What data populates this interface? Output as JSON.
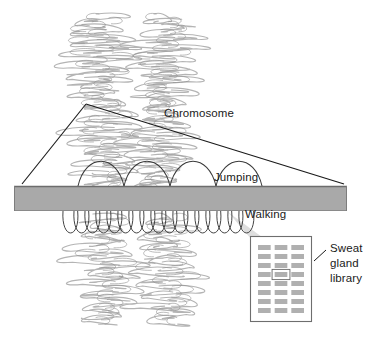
{
  "figure": {
    "background_color": "#ffffff",
    "width": 377,
    "height": 341,
    "top_cut_caption": "",
    "labels": {
      "chromosome": "Chromosome",
      "jumping": "Jumping",
      "walking": "Walking",
      "library_line1": "Sweat",
      "library_line2": "gland",
      "library_line3": "library"
    },
    "colors": {
      "chromatin": "#b4b4b4",
      "chromatin_dark": "#8e8e8e",
      "bar_fill": "#a9a9a9",
      "bar_edge": "#6e6e6e",
      "leader_line": "#1a1a1a",
      "loop_stroke": "#3a3a3a",
      "band_fill": "#b0b0b0",
      "band_highlight_stroke": "#6a6a6a",
      "box_edge": "#6e6e6e",
      "cone_fill": "#d8d8d8",
      "text": "#1a1a1a"
    },
    "chromosome": {
      "description": "Metaphase chromosome drawn as two sister chromatids of densely coiled chromatin loops",
      "arm_count": 2,
      "left_arm_center_x": 104,
      "right_arm_center_x": 163,
      "top_y": 14,
      "bottom_y": 322
    },
    "bar": {
      "name": "chromosome-region-bar",
      "x": 14,
      "y": 186,
      "width": 333,
      "height": 25
    },
    "jumping_arcs": {
      "count": 4,
      "description": "Large arcs above the bar representing chromosome jumping over long distances",
      "start_x": 78,
      "arc_width": 46,
      "arc_height": 22,
      "baseline_y": 186
    },
    "walking_loops": {
      "count": 17,
      "description": "Small tight successive loops below the bar representing stepwise chromosome walking",
      "start_x": 63,
      "loop_width": 11,
      "loop_height": 24,
      "baseline_y": 211
    },
    "leader_lines": [
      {
        "name": "chromosome-leader-left",
        "x1": 86,
        "y1": 104,
        "x2": 22,
        "y2": 184
      },
      {
        "name": "chromosome-leader-right",
        "x1": 86,
        "y1": 104,
        "x2": 344,
        "y2": 184
      }
    ],
    "library_pointer": {
      "name": "library-pointer-line",
      "x1": 325,
      "y1": 252,
      "x2": 313,
      "y2": 262
    },
    "library_cone": {
      "name": "walking-to-library-cone",
      "apex_x": 228,
      "apex_y": 212,
      "base_left_x": 252,
      "base_right_x": 266,
      "base_y": 240
    }
  },
  "library_box": {
    "name": "sweat-gland-library-panel",
    "x": 250,
    "y": 236,
    "width": 62,
    "height": 86,
    "columns": 3,
    "rows": 8,
    "highlighted_band": {
      "row": 4,
      "column": 2
    },
    "bands": [
      [
        "band",
        "band",
        "band"
      ],
      [
        "band",
        "band",
        "band"
      ],
      [
        "band",
        "band",
        "band"
      ],
      [
        "band",
        "band-highlighted",
        "band"
      ],
      [
        "band",
        "band",
        "band"
      ],
      [
        "band",
        "band",
        "band"
      ],
      [
        "band",
        "band",
        "band"
      ],
      [
        "band",
        "band",
        "band"
      ]
    ]
  }
}
